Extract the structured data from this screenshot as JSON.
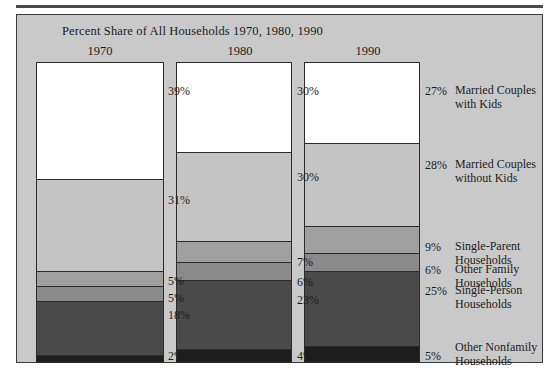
{
  "chart_data": {
    "type": "bar",
    "subtype": "stacked-column",
    "title": "Percent Share of All Households 1970, 1980, 1990",
    "xlabel": "",
    "ylabel": "",
    "ylim": [
      0,
      100
    ],
    "grid": false,
    "legend_position": "right",
    "categories": [
      "1970",
      "1980",
      "1990"
    ],
    "series": [
      {
        "name": "Married Couples with Kids",
        "color": "#ffffff",
        "values": [
          39,
          30,
          27
        ]
      },
      {
        "name": "Married Couples without Kids",
        "color": "#c4c4c4",
        "values": [
          31,
          30,
          28
        ]
      },
      {
        "name": "Single-Parent Households",
        "color": "#a0a0a0",
        "values": [
          5,
          7,
          9
        ]
      },
      {
        "name": "Other Family Households",
        "color": "#8a8a8a",
        "values": [
          5,
          6,
          6
        ]
      },
      {
        "name": "Single-Person Households",
        "color": "#4a4a4a",
        "values": [
          18,
          23,
          25
        ]
      },
      {
        "name": "Other Nonfamily Households",
        "color": "#1e1e1e",
        "values": [
          2,
          4,
          5
        ]
      }
    ],
    "columns": [
      {
        "year": "1970",
        "segments": [
          {
            "label": "Married Couples with Kids",
            "value": 39,
            "value_label": "39%",
            "color": "#ffffff"
          },
          {
            "label": "Married Couples without Kids",
            "value": 31,
            "value_label": "31%",
            "color": "#c4c4c4"
          },
          {
            "label": "Single-Parent Households",
            "value": 5,
            "value_label": "5%",
            "color": "#a0a0a0"
          },
          {
            "label": "Other Family Households",
            "value": 5,
            "value_label": "5%",
            "color": "#8a8a8a"
          },
          {
            "label": "Single-Person Households",
            "value": 18,
            "value_label": "18%",
            "color": "#4a4a4a"
          },
          {
            "label": "Other Nonfamily Households",
            "value": 2,
            "value_label": "2%",
            "color": "#1e1e1e"
          }
        ]
      },
      {
        "year": "1980",
        "segments": [
          {
            "label": "Married Couples with Kids",
            "value": 30,
            "value_label": "30%",
            "color": "#ffffff"
          },
          {
            "label": "Married Couples without Kids",
            "value": 30,
            "value_label": "30%",
            "color": "#c4c4c4"
          },
          {
            "label": "Single-Parent Households",
            "value": 7,
            "value_label": "7%",
            "color": "#a0a0a0"
          },
          {
            "label": "Other Family Households",
            "value": 6,
            "value_label": "6%",
            "color": "#8a8a8a"
          },
          {
            "label": "Single-Person Households",
            "value": 23,
            "value_label": "23%",
            "color": "#4a4a4a"
          },
          {
            "label": "Other Nonfamily Households",
            "value": 4,
            "value_label": "4%",
            "color": "#1e1e1e"
          }
        ]
      },
      {
        "year": "1990",
        "segments": [
          {
            "label": "Married Couples with Kids",
            "value": 27,
            "value_label": "27%",
            "color": "#ffffff"
          },
          {
            "label": "Married Couples without Kids",
            "value": 28,
            "value_label": "28%",
            "color": "#c4c4c4"
          },
          {
            "label": "Single-Parent Households",
            "value": 9,
            "value_label": "9%",
            "color": "#a0a0a0"
          },
          {
            "label": "Other Family Households",
            "value": 6,
            "value_label": "6%",
            "color": "#8a8a8a"
          },
          {
            "label": "Single-Person Households",
            "value": 25,
            "value_label": "25%",
            "color": "#4a4a4a"
          },
          {
            "label": "Other Nonfamily Households",
            "value": 5,
            "value_label": "5%",
            "color": "#1e1e1e"
          }
        ]
      }
    ],
    "legend_entries": [
      {
        "text": "Married Couples\nwith Kids"
      },
      {
        "text": "Married Couples\nwithout Kids"
      },
      {
        "text": "Single-Parent Households"
      },
      {
        "text": "Other Family Households"
      },
      {
        "text": "Single-Person Households"
      },
      {
        "text": "Other Nonfamily\nHouseholds"
      }
    ]
  },
  "colors": {
    "panel_background": "#c9c9c9",
    "page_background": "#ffffff",
    "text": "#1c1c1c",
    "outline": "#2b2b2b"
  }
}
